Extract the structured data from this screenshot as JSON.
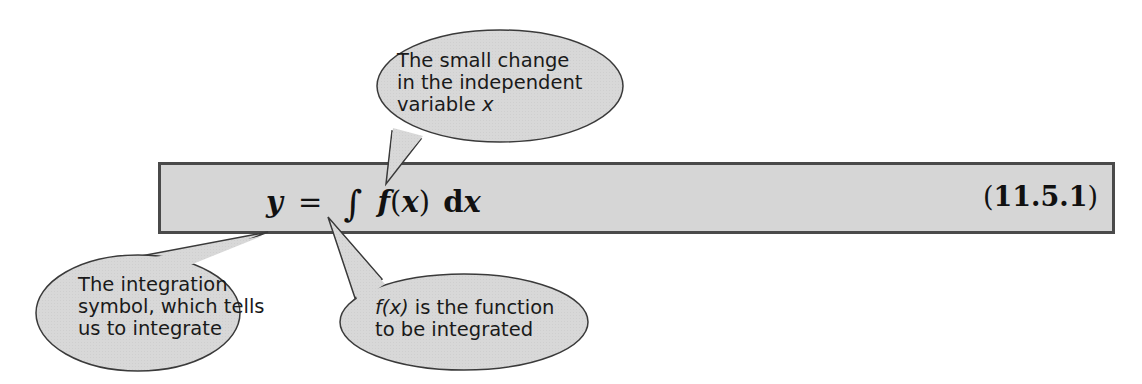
{
  "equation": {
    "lhs": "y",
    "equals": "=",
    "integral_symbol": "∫",
    "function_name": "f",
    "open_paren": "(",
    "variable": "x",
    "close_paren": ")",
    "differential_d": "d",
    "differential_var": "x",
    "number_open": "(",
    "number": "11.5.1",
    "number_close": ")"
  },
  "callouts": {
    "top": {
      "line1": "The small change",
      "line2": "in the independent",
      "line3_text": "variable ",
      "line3_var": "x"
    },
    "bottom_left": {
      "line1": "The integration",
      "line2": "symbol, which tells",
      "line3": "us to integrate"
    },
    "bottom_right": {
      "line1_expr": "f(x)",
      "line1_text": " is the function",
      "line2": "to be integrated"
    }
  },
  "colors": {
    "box_fill": "#d6d6d6",
    "box_border": "#4a4a4a",
    "bubble_fill": "#d8d8d8",
    "bubble_stroke": "#3a3a3a"
  }
}
